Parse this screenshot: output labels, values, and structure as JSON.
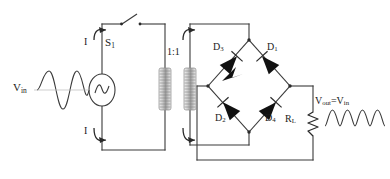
{
  "diagram": {
    "background_color": "#ffffff",
    "line_color": "#3a3a3a",
    "text_color": "#1a1a1a",
    "diode_fill": "#111111"
  },
  "labels": {
    "v_in": "V",
    "v_in_sub": "in",
    "switch": "S",
    "switch_sub": "1",
    "current_top": "I",
    "current_bottom": "I",
    "turns_ratio": "1:1",
    "d1": "D",
    "d1_sub": "1",
    "d2": "D",
    "d2_sub": "2",
    "d3": "D",
    "d3_sub": "3",
    "d4": "D",
    "d4_sub": "4",
    "load": "R",
    "load_sub": "L",
    "v_out": "V",
    "v_out_sub": "out",
    "v_out_eq": "=V",
    "v_out_eq_sub": "in"
  },
  "components": [
    {
      "name": "ac-source",
      "type": "ac-voltage-source",
      "label": "V_in"
    },
    {
      "name": "switch-s1",
      "type": "spst-switch",
      "label": "S1",
      "state": "open"
    },
    {
      "name": "transformer",
      "type": "transformer",
      "ratio": "1:1"
    },
    {
      "name": "diode-d1",
      "type": "diode",
      "label": "D1",
      "position": "upper-right"
    },
    {
      "name": "diode-d2",
      "type": "diode",
      "label": "D2",
      "position": "lower-left"
    },
    {
      "name": "diode-d3",
      "type": "diode",
      "label": "D3",
      "position": "upper-left"
    },
    {
      "name": "diode-d4",
      "type": "diode",
      "label": "D4",
      "position": "lower-right"
    },
    {
      "name": "load-resistor",
      "type": "resistor",
      "label": "RL"
    }
  ],
  "waveforms": {
    "input": {
      "name": "input-sine-wave",
      "type": "sine",
      "cycles": 2,
      "label": "V_in"
    },
    "output": {
      "name": "output-rectified-wave",
      "type": "full-wave-rectified",
      "humps": 4,
      "label": "V_out=V_in"
    },
    "source_symbol": {
      "name": "ac-source-sine-glyph",
      "type": "sine",
      "cycles": 1
    }
  }
}
